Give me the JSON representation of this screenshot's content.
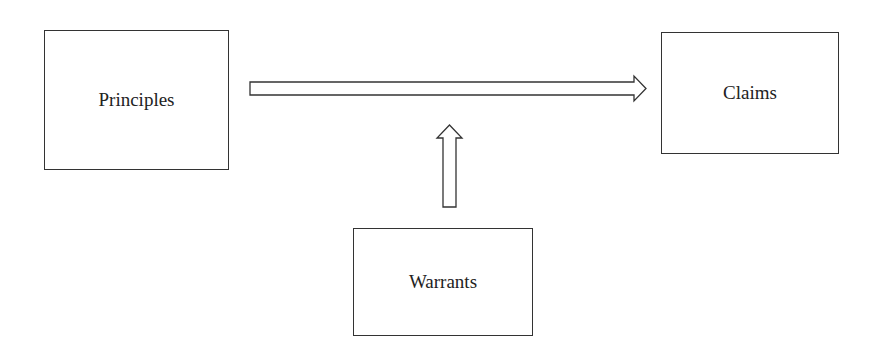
{
  "nodes": {
    "principles": {
      "label": "Principles"
    },
    "claims": {
      "label": "Claims"
    },
    "warrants": {
      "label": "Warrants"
    }
  },
  "edges": [
    {
      "from": "principles",
      "to": "claims",
      "style": "hollow-block-arrow"
    },
    {
      "from": "warrants",
      "to": "principles-claims-arrow",
      "style": "hollow-block-arrow"
    }
  ]
}
